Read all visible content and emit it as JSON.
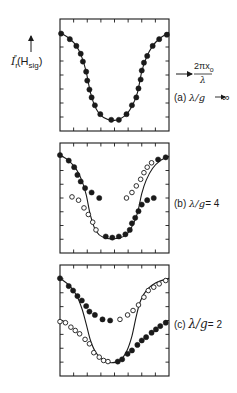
{
  "figure": {
    "y_axis_label": {
      "main": "I",
      "sub": "r",
      "sup": "″",
      "arg_open": "(H",
      "arg_sub": "sig",
      "arg_close": ")"
    },
    "x_axis_label": {
      "numerator": "2πx",
      "numerator_sub": "o",
      "denominator": "λ"
    },
    "panels": [
      {
        "id": "a",
        "tag": "(a)",
        "condition": "λ/g",
        "relation": "→ ∞"
      },
      {
        "id": "b",
        "tag": "(b)",
        "condition": "λ/g",
        "relation": "= 4"
      },
      {
        "id": "c",
        "tag": "(c)",
        "condition": "λ/g",
        "relation": "= 2"
      }
    ]
  },
  "colors": {
    "ink": "#1a1a1a",
    "background": "#ffffff"
  },
  "chart_data": [
    {
      "type": "scatter",
      "title": "(a) λ/g → ∞",
      "xlabel": "2πx₀/λ",
      "ylabel": "I″r(H_sig)",
      "xlim": [
        0,
        1
      ],
      "ylim": [
        0,
        1
      ],
      "grid": false,
      "ticks": {
        "x_divisions": 8,
        "y_divisions": 8
      },
      "curve": [
        [
          0.0,
          0.12
        ],
        [
          0.08,
          0.17
        ],
        [
          0.15,
          0.24
        ],
        [
          0.2,
          0.34
        ],
        [
          0.24,
          0.47
        ],
        [
          0.28,
          0.66
        ],
        [
          0.33,
          0.8
        ],
        [
          0.4,
          0.88
        ],
        [
          0.5,
          0.905
        ],
        [
          0.6,
          0.86
        ],
        [
          0.66,
          0.78
        ],
        [
          0.71,
          0.66
        ],
        [
          0.75,
          0.47
        ],
        [
          0.79,
          0.35
        ],
        [
          0.85,
          0.24
        ],
        [
          0.92,
          0.17
        ],
        [
          1.0,
          0.12
        ]
      ],
      "series": [
        {
          "name": "filled",
          "marker": "filled",
          "points": [
            [
              0.01,
              0.13
            ],
            [
              0.09,
              0.18
            ],
            [
              0.15,
              0.24
            ],
            [
              0.19,
              0.31
            ],
            [
              0.21,
              0.38
            ],
            [
              0.24,
              0.47
            ],
            [
              0.25,
              0.55
            ],
            [
              0.27,
              0.63
            ],
            [
              0.29,
              0.7
            ],
            [
              0.32,
              0.77
            ],
            [
              0.37,
              0.85
            ],
            [
              0.47,
              0.9
            ],
            [
              0.54,
              0.9
            ],
            [
              0.61,
              0.85
            ],
            [
              0.66,
              0.77
            ],
            [
              0.7,
              0.7
            ],
            [
              0.72,
              0.62
            ],
            [
              0.74,
              0.54
            ],
            [
              0.75,
              0.46
            ],
            [
              0.77,
              0.39
            ],
            [
              0.8,
              0.33
            ],
            [
              0.85,
              0.24
            ],
            [
              0.91,
              0.18
            ],
            [
              0.98,
              0.14
            ]
          ]
        }
      ]
    },
    {
      "type": "scatter",
      "title": "(b) λ/g = 4",
      "xlim": [
        0,
        1
      ],
      "ylim": [
        0,
        1
      ],
      "grid": false,
      "ticks": {
        "x_divisions": 8,
        "y_divisions": 8
      },
      "curve": [
        [
          0.0,
          0.11
        ],
        [
          0.08,
          0.16
        ],
        [
          0.15,
          0.24
        ],
        [
          0.2,
          0.34
        ],
        [
          0.24,
          0.47
        ],
        [
          0.28,
          0.66
        ],
        [
          0.33,
          0.8
        ],
        [
          0.4,
          0.86
        ],
        [
          0.5,
          0.87
        ],
        [
          0.6,
          0.84
        ],
        [
          0.66,
          0.76
        ],
        [
          0.71,
          0.64
        ],
        [
          0.75,
          0.46
        ],
        [
          0.79,
          0.34
        ],
        [
          0.85,
          0.23
        ],
        [
          0.92,
          0.16
        ],
        [
          1.0,
          0.12
        ]
      ],
      "series": [
        {
          "name": "filled",
          "marker": "filled",
          "points": [
            [
              0.0,
              0.11
            ],
            [
              0.08,
              0.16
            ],
            [
              0.13,
              0.22
            ],
            [
              0.16,
              0.29
            ],
            [
              0.19,
              0.35
            ],
            [
              0.23,
              0.41
            ],
            [
              0.29,
              0.45
            ],
            [
              0.36,
              0.5
            ],
            [
              0.42,
              0.85
            ],
            [
              0.48,
              0.86
            ],
            [
              0.54,
              0.85
            ],
            [
              0.6,
              0.83
            ],
            [
              0.64,
              0.79
            ],
            [
              0.66,
              0.73
            ],
            [
              0.69,
              0.68
            ],
            [
              0.72,
              0.62
            ],
            [
              0.75,
              0.56
            ],
            [
              0.8,
              0.52
            ],
            [
              0.86,
              0.5
            ],
            [
              0.9,
              0.15
            ],
            [
              0.97,
              0.13
            ]
          ]
        },
        {
          "name": "open",
          "marker": "open",
          "points": [
            [
              0.11,
              0.49
            ],
            [
              0.17,
              0.52
            ],
            [
              0.22,
              0.59
            ],
            [
              0.26,
              0.65
            ],
            [
              0.3,
              0.72
            ],
            [
              0.33,
              0.79
            ],
            [
              0.61,
              0.5
            ],
            [
              0.66,
              0.45
            ],
            [
              0.7,
              0.39
            ],
            [
              0.74,
              0.33
            ],
            [
              0.77,
              0.27
            ],
            [
              0.8,
              0.22
            ],
            [
              0.84,
              0.18
            ]
          ]
        }
      ]
    },
    {
      "type": "scatter",
      "title": "(c) λ/g = 2",
      "xlim": [
        0,
        1
      ],
      "ylim": [
        0,
        1
      ],
      "grid": false,
      "ticks": {
        "x_divisions": 8,
        "y_divisions": 8
      },
      "curve": [
        [
          0.0,
          0.12
        ],
        [
          0.08,
          0.18
        ],
        [
          0.15,
          0.27
        ],
        [
          0.2,
          0.39
        ],
        [
          0.24,
          0.53
        ],
        [
          0.28,
          0.68
        ],
        [
          0.33,
          0.79
        ],
        [
          0.4,
          0.86
        ],
        [
          0.47,
          0.88
        ],
        [
          0.55,
          0.86
        ],
        [
          0.61,
          0.78
        ],
        [
          0.66,
          0.64
        ],
        [
          0.7,
          0.46
        ],
        [
          0.74,
          0.32
        ],
        [
          0.8,
          0.22
        ],
        [
          0.88,
          0.16
        ],
        [
          1.0,
          0.12
        ]
      ],
      "series": [
        {
          "name": "filled",
          "marker": "filled",
          "points": [
            [
              0.0,
              0.12
            ],
            [
              0.08,
              0.19
            ],
            [
              0.12,
              0.23
            ],
            [
              0.16,
              0.28
            ],
            [
              0.2,
              0.32
            ],
            [
              0.24,
              0.37
            ],
            [
              0.27,
              0.42
            ],
            [
              0.32,
              0.45
            ],
            [
              0.39,
              0.49
            ],
            [
              0.46,
              0.5
            ],
            [
              0.53,
              0.87
            ],
            [
              0.57,
              0.85
            ],
            [
              0.62,
              0.8
            ],
            [
              0.66,
              0.77
            ],
            [
              0.71,
              0.72
            ],
            [
              0.75,
              0.68
            ],
            [
              0.79,
              0.65
            ],
            [
              0.84,
              0.61
            ],
            [
              0.88,
              0.58
            ],
            [
              0.92,
              0.55
            ],
            [
              0.97,
              0.52
            ]
          ]
        },
        {
          "name": "open",
          "marker": "open",
          "points": [
            [
              0.55,
              0.49
            ],
            [
              0.62,
              0.45
            ],
            [
              0.67,
              0.41
            ],
            [
              0.72,
              0.36
            ],
            [
              0.77,
              0.29
            ],
            [
              0.81,
              0.23
            ],
            [
              0.86,
              0.2
            ],
            [
              0.91,
              0.17
            ],
            [
              0.97,
              0.14
            ],
            [
              0.0,
              0.51
            ],
            [
              0.05,
              0.52
            ],
            [
              0.1,
              0.56
            ],
            [
              0.14,
              0.59
            ],
            [
              0.18,
              0.62
            ],
            [
              0.23,
              0.67
            ],
            [
              0.27,
              0.71
            ],
            [
              0.31,
              0.79
            ],
            [
              0.36,
              0.83
            ],
            [
              0.4,
              0.86
            ],
            [
              0.44,
              0.87
            ]
          ]
        }
      ]
    }
  ]
}
